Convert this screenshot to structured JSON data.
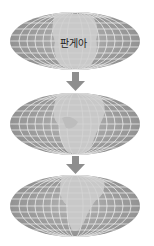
{
  "title_cutoff": "",
  "stages": [
    {
      "name": "pangaea",
      "label": "판게아",
      "cx": 75,
      "cy": 41,
      "rx": 65,
      "ry": 29
    },
    {
      "name": "breakup",
      "label": "",
      "cx": 75,
      "cy": 124,
      "rx": 65,
      "ry": 31
    },
    {
      "name": "present",
      "label": "",
      "cx": 75,
      "cy": 206,
      "rx": 65,
      "ry": 31
    }
  ],
  "arrows": [
    {
      "from": 0,
      "to": 1,
      "x": 75,
      "y_top": 72,
      "y_bottom": 91
    },
    {
      "from": 1,
      "to": 2,
      "x": 75,
      "y_top": 156,
      "y_bottom": 174
    }
  ],
  "colors": {
    "ocean": "#9c9c9c",
    "land": "#c9c9c9",
    "grid": "#f4f4f4",
    "arrow": "#8e8e8e",
    "label": "#222222"
  }
}
